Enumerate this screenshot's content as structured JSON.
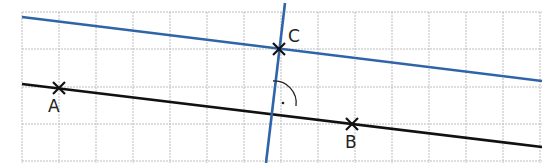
{
  "diagram": {
    "type": "geometry-construction",
    "grid": {
      "x0": 22,
      "y0": 12,
      "cell": 37,
      "cols": 14,
      "rows": 4,
      "color": "#bdbdbd"
    },
    "points": [
      {
        "id": "A",
        "label": "A",
        "x": 59,
        "y": 88,
        "label_x": 48,
        "label_y": 112
      },
      {
        "id": "B",
        "label": "B",
        "x": 352,
        "y": 124,
        "label_x": 345,
        "label_y": 148
      },
      {
        "id": "C",
        "label": "C",
        "x": 279,
        "y": 49,
        "label_x": 288,
        "label_y": 42
      }
    ],
    "lines": [
      {
        "id": "line-AB",
        "color": "#111111",
        "x1": 22,
        "y1": 84,
        "x2": 542,
        "y2": 147
      },
      {
        "id": "parallel-through-C",
        "color": "#2f64a8",
        "x1": 22,
        "y1": 17,
        "x2": 542,
        "y2": 81
      },
      {
        "id": "perpendicular-through-C",
        "color": "#2f64a8",
        "x1": 285,
        "y1": 3,
        "x2": 266,
        "y2": 163
      }
    ],
    "right_angle_marker": {
      "cx": 274,
      "cy": 103,
      "r": 22,
      "dot_x": 283,
      "dot_y": 103
    }
  }
}
